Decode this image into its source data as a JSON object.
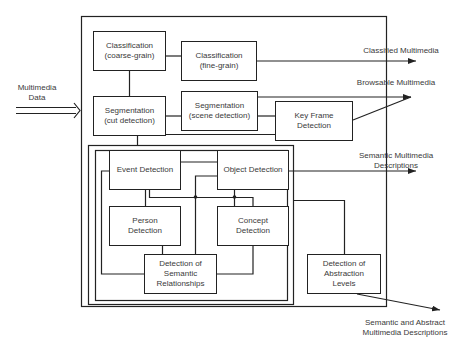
{
  "input": {
    "line1": "Multimedia",
    "line2": "Data"
  },
  "boxes": {
    "class_coarse": {
      "line1": "Classification",
      "line2": "(coarse-grain)"
    },
    "class_fine": {
      "line1": "Classification",
      "line2": "(fine-grain)"
    },
    "seg_cut": {
      "line1": "Segmentation",
      "line2": "(cut detection)"
    },
    "seg_scene": {
      "line1": "Segmentation",
      "line2": "(scene detection)"
    },
    "key_frame": {
      "line1": "Key Frame",
      "line2": "Detection"
    },
    "event": {
      "line1": "Event Detection"
    },
    "object": {
      "line1": "Object Detection"
    },
    "person": {
      "line1": "Person",
      "line2": "Detection"
    },
    "concept": {
      "line1": "Concept",
      "line2": "Detection"
    },
    "semantic_rel": {
      "line1": "Detection of",
      "line2": "Semantic",
      "line3": "Relationships"
    },
    "abstraction": {
      "line1": "Detection of",
      "line2": "Abstraction",
      "line3": "Levels"
    }
  },
  "outputs": {
    "classified": "Classified Multimedia",
    "browsable": "Browsable Multimedia",
    "semantic": {
      "line1": "Semantic Multimedia",
      "line2": "Descriptions"
    },
    "abstract": {
      "line1": "Semantic and Abstract",
      "line2": "Multimedia Descriptions"
    }
  },
  "colors": {
    "line": "#222222",
    "text": "#3a3a3a",
    "background": "#ffffff"
  }
}
